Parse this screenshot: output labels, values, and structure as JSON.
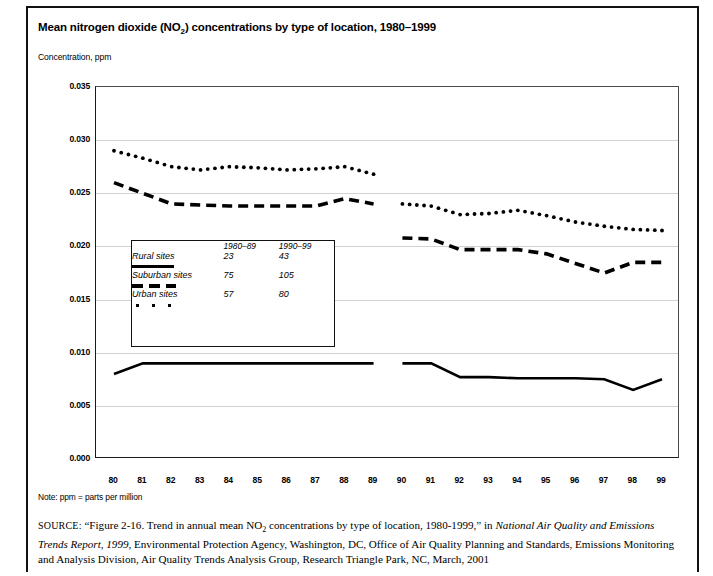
{
  "figure": {
    "title_prefix": "Mean nitrogen dioxide (NO",
    "title_sub": "2",
    "title_suffix": ") concentrations by type of location, 1980–1999",
    "axis_caption": "Concentration, ppm",
    "note": "Note: ppm = parts per million",
    "source_label": "SOURCE:",
    "source_part1": "“Figure 2-16. Trend in annual mean NO",
    "source_sub": "2",
    "source_part2": " concentrations  by type of location, 1980-1999,” in ",
    "source_italic1": "National Air Quality and Emissions Trends Report, 1999",
    "source_part3": ", Environmental Protection Agency, Washington, DC, Office of Air Quality Planning and Standards, Emissions Monitoring and Analysis Division, Air Quality Trends Analysis Group, Research Triangle Park, NC, March, 2001"
  },
  "legend": {
    "col_headers": [
      "1980–89",
      "1990–99"
    ],
    "rows": [
      {
        "label": "Rural sites",
        "style": "solid",
        "counts": [
          "23",
          "43"
        ]
      },
      {
        "label": "Suburban sites",
        "style": "dashed",
        "counts": [
          "75",
          "105"
        ]
      },
      {
        "label": "Urban sites",
        "style": "dotted",
        "counts": [
          "57",
          "80"
        ]
      }
    ]
  },
  "chart_data": {
    "type": "line",
    "title": "Mean nitrogen dioxide (NO2) concentrations by type of location, 1980–1999",
    "xlabel": "",
    "ylabel": "Concentration, ppm",
    "ylim": [
      0.0,
      0.035
    ],
    "xlim": [
      1980,
      1999
    ],
    "grid": true,
    "legend_position": "inside-left",
    "ytick_labels": [
      "0.000",
      "0.005",
      "0.010",
      "0.015",
      "0.020",
      "0.025",
      "0.030",
      "0.035"
    ],
    "ytick_values": [
      0.0,
      0.005,
      0.01,
      0.015,
      0.02,
      0.025,
      0.03,
      0.035
    ],
    "xtick_labels": [
      "80",
      "81",
      "82",
      "83",
      "84",
      "85",
      "86",
      "87",
      "88",
      "89",
      "90",
      "91",
      "92",
      "93",
      "94",
      "95",
      "96",
      "97",
      "98",
      "99"
    ],
    "x": [
      1980,
      1981,
      1982,
      1983,
      1984,
      1985,
      1986,
      1987,
      1988,
      1989,
      1990,
      1991,
      1992,
      1993,
      1994,
      1995,
      1996,
      1997,
      1998,
      1999
    ],
    "series": [
      {
        "name": "Rural sites",
        "style": "solid",
        "segments": [
          {
            "period": "1980-89",
            "x": [
              1980,
              1981,
              1982,
              1983,
              1984,
              1985,
              1986,
              1987,
              1988,
              1989
            ],
            "values": [
              0.008,
              0.009,
              0.009,
              0.009,
              0.009,
              0.009,
              0.009,
              0.009,
              0.009,
              0.009
            ]
          },
          {
            "period": "1990-99",
            "x": [
              1990,
              1991,
              1992,
              1993,
              1994,
              1995,
              1996,
              1997,
              1998,
              1999
            ],
            "values": [
              0.009,
              0.009,
              0.0077,
              0.0077,
              0.0076,
              0.0076,
              0.0076,
              0.0075,
              0.0065,
              0.0075
            ]
          }
        ]
      },
      {
        "name": "Suburban sites",
        "style": "dashed",
        "segments": [
          {
            "period": "1980-89",
            "x": [
              1980,
              1981,
              1982,
              1983,
              1984,
              1985,
              1986,
              1987,
              1988,
              1989
            ],
            "values": [
              0.026,
              0.025,
              0.024,
              0.0239,
              0.0238,
              0.0238,
              0.0238,
              0.0238,
              0.0245,
              0.024
            ]
          },
          {
            "period": "1990-99",
            "x": [
              1990,
              1991,
              1992,
              1993,
              1994,
              1995,
              1996,
              1997,
              1998,
              1999
            ],
            "values": [
              0.0208,
              0.0207,
              0.0197,
              0.0197,
              0.0197,
              0.0193,
              0.0184,
              0.0175,
              0.0185,
              0.0185
            ]
          }
        ]
      },
      {
        "name": "Urban sites",
        "style": "dotted",
        "segments": [
          {
            "period": "1980-89",
            "x": [
              1980,
              1981,
              1982,
              1983,
              1984,
              1985,
              1986,
              1987,
              1988,
              1989
            ],
            "values": [
              0.029,
              0.0283,
              0.0275,
              0.0272,
              0.0275,
              0.0274,
              0.0272,
              0.0273,
              0.0275,
              0.0268
            ]
          },
          {
            "period": "1990-99",
            "x": [
              1990,
              1991,
              1992,
              1993,
              1994,
              1995,
              1996,
              1997,
              1998,
              1999
            ],
            "values": [
              0.024,
              0.0238,
              0.023,
              0.0231,
              0.0234,
              0.0229,
              0.0223,
              0.0219,
              0.0216,
              0.0215
            ]
          }
        ]
      }
    ]
  }
}
